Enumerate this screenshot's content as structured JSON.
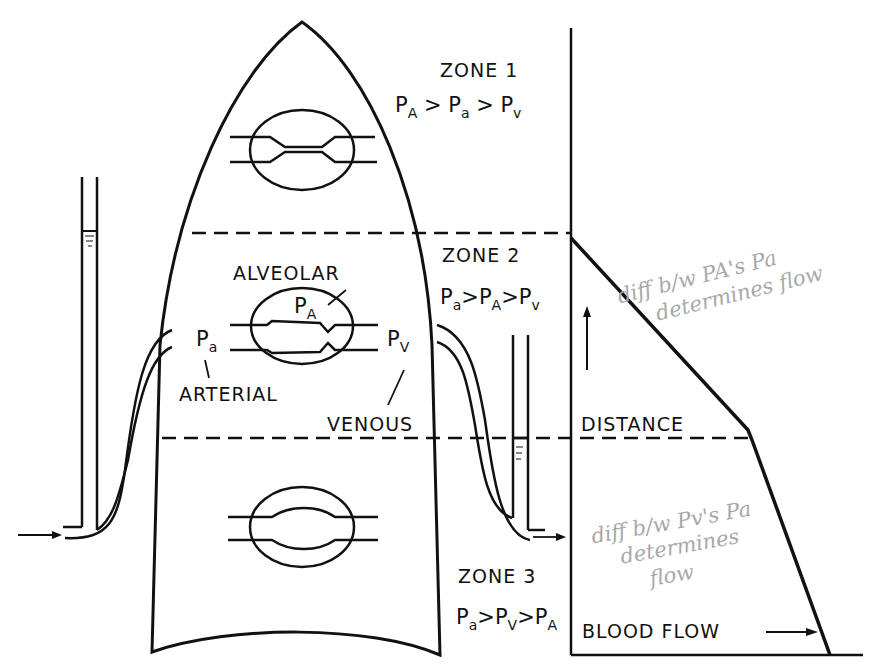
{
  "figure": {
    "type": "lung zones diagram (West zones)",
    "zones": [
      {
        "id": "zone1",
        "title": "ZONE 1",
        "inequality": {
          "t1": "P",
          "s1": "A",
          "g1": " > ",
          "t2": "P",
          "s2": "a",
          "g2": " > ",
          "t3": "P",
          "s3": "v"
        }
      },
      {
        "id": "zone2",
        "title": "ZONE 2",
        "inequality": {
          "t1": "P",
          "s1": "a",
          "g1": ">",
          "t2": "P",
          "s2": "A",
          "g2": ">",
          "t3": "P",
          "s3": "v"
        }
      },
      {
        "id": "zone3",
        "title": "ZONE 3",
        "inequality": {
          "t1": "P",
          "s1": "a",
          "g1": ">",
          "t2": "P",
          "s2": "V",
          "g2": ">",
          "t3": "P",
          "s3": "A"
        }
      }
    ],
    "labels": {
      "alveolar": "ALVEOLAR",
      "arterial": "ARTERIAL",
      "venous": "VENOUS",
      "p_alveolar": {
        "t": "P",
        "s": "A"
      },
      "p_arterial": {
        "t": "P",
        "s": "a"
      },
      "p_venous": {
        "t": "P",
        "s": "V"
      }
    },
    "graph": {
      "y_axis_label": "DISTANCE",
      "x_axis_label": "BLOOD FLOW",
      "arrow": "→"
    },
    "handwritten_notes": [
      {
        "id": "note-zone2",
        "line1": "diff b/w PA's Pa",
        "line2": "determines flow"
      },
      {
        "id": "note-zone3",
        "line1": "diff b/w Pv's Pa",
        "line2": "determines",
        "line3": "flow"
      }
    ],
    "colors": {
      "ink": "#111111",
      "pencil": "#a8a8a8",
      "background": "#ffffff"
    }
  }
}
